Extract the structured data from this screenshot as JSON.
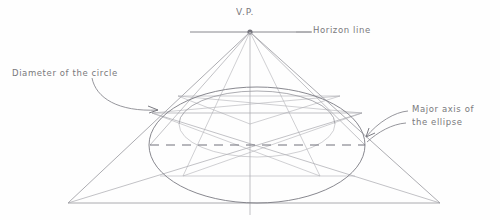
{
  "diagram": {
    "medium": "pencil sketch on white paper",
    "ink_color": "#8a8a90",
    "label_color": "#6e6e72",
    "background_color": "#fefefe"
  },
  "labels": {
    "vanishing_point": "V.P.",
    "horizon_line": "Horizon line",
    "diameter_of_circle": "Diameter of the circle",
    "major_axis_line1": "Major axis of",
    "major_axis_line2": "the ellipse"
  },
  "geometry": {
    "vanishing_point": {
      "x": 250,
      "y": 32
    },
    "horizon_line": {
      "x1": 190,
      "y1": 32,
      "x2": 312,
      "y2": 32
    },
    "vertical_axis": {
      "x": 250,
      "y1": 32,
      "y2": 215
    },
    "base_line": {
      "x1": 68,
      "y1": 203,
      "x2": 440,
      "y2": 203
    },
    "triangle_left_corner": {
      "x": 68,
      "y": 203
    },
    "triangle_right_corner": {
      "x": 440,
      "y": 203
    },
    "outer_ellipse": {
      "cx": 257,
      "cy": 145,
      "rx": 108,
      "ry": 58
    },
    "inner_ellipse": {
      "cx": 257,
      "cy": 124,
      "rx": 78,
      "ry": 33
    },
    "major_axis_dashed": {
      "x1": 150,
      "y1": 145,
      "x2": 365,
      "y2": 145
    },
    "upper_chord": {
      "x1": 152,
      "y1": 113,
      "x2": 362,
      "y2": 113
    },
    "lower_chord": {
      "x1": 160,
      "y1": 176,
      "x2": 355,
      "y2": 176
    }
  }
}
